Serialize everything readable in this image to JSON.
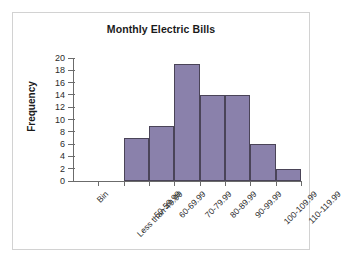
{
  "chart_data": {
    "type": "bar",
    "title": "Monthly Electric Bills",
    "xlabel": "",
    "ylabel": "Frequency",
    "categories": [
      "Bin",
      "Less than 49.99",
      "50-59.99",
      "60-69.99",
      "70-79.99",
      "80-89.99",
      "90-99.99",
      "100-109.99",
      "110-119.99"
    ],
    "values": [
      0,
      0,
      7,
      9,
      19,
      14,
      14,
      6,
      2
    ],
    "ylim": [
      0,
      20
    ],
    "ytick_step": 2,
    "yticks": [
      0,
      2,
      4,
      6,
      8,
      10,
      12,
      14,
      16,
      18,
      20
    ],
    "grid": false,
    "legend": false,
    "bar_color": "#8a81ab",
    "bar_edge_color": "#4a4458",
    "axis_color": "#6b6b6b",
    "background_color": "#ffffff",
    "frame_color": "#d2d2d2"
  }
}
